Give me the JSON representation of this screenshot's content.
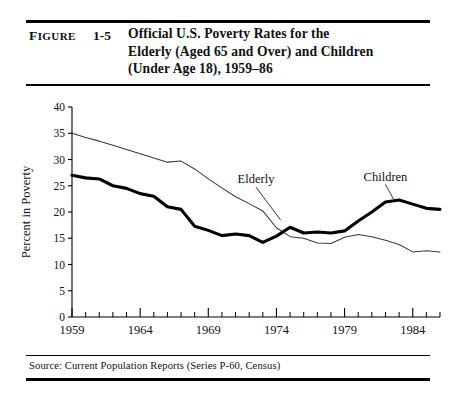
{
  "figure": {
    "label": "Figure",
    "number": "1-5",
    "title_lines": [
      "Official U.S. Poverty Rates for the",
      "Elderly (Aged 65 and Over) and Children",
      "(Under Age 18), 1959–86"
    ]
  },
  "source": {
    "text": "Source: Current Population Reports (Series P-60, Census)"
  },
  "annotations": {
    "elderly_label": "Elderly",
    "children_label": "Children"
  },
  "chart_data": {
    "type": "line",
    "title": "Official U.S. Poverty Rates for the Elderly (Aged 65 and Over) and Children (Under Age 18), 1959–86",
    "xlabel": "Year",
    "ylabel": "Percent in Poverty",
    "xlim": [
      1959,
      1986
    ],
    "ylim": [
      0,
      40
    ],
    "ytick_values": [
      0,
      5,
      10,
      15,
      20,
      25,
      30,
      35,
      40
    ],
    "ytick_labels": [
      "0",
      "5",
      "10",
      "15",
      "20",
      "25",
      "30",
      "35",
      "40"
    ],
    "xtick_major_values": [
      1959,
      1964,
      1969,
      1974,
      1979,
      1984
    ],
    "xtick_major_labels": [
      "1959",
      "1964",
      "1969",
      "1974",
      "1979",
      "1984"
    ],
    "xtick_minor_step": 1,
    "grid": false,
    "legend_position": "inline-annotations",
    "x": [
      1959,
      1960,
      1961,
      1962,
      1963,
      1964,
      1965,
      1966,
      1967,
      1968,
      1969,
      1970,
      1971,
      1972,
      1973,
      1974,
      1975,
      1976,
      1977,
      1978,
      1979,
      1980,
      1981,
      1982,
      1983,
      1984,
      1985,
      1986
    ],
    "series": [
      {
        "name": "Elderly",
        "style": "thin",
        "color": "#3a3a3a",
        "values": [
          35.0,
          34.2,
          33.5,
          32.7,
          31.9,
          31.1,
          30.3,
          29.5,
          29.7,
          28.2,
          26.3,
          24.6,
          22.9,
          21.6,
          20.2,
          17.0,
          15.3,
          15.0,
          14.1,
          14.0,
          15.2,
          15.7,
          15.3,
          14.6,
          13.8,
          12.4,
          12.6,
          12.4
        ]
      },
      {
        "name": "Children",
        "style": "thick",
        "color": "#000000",
        "values": [
          27.0,
          26.5,
          26.3,
          25.0,
          24.5,
          23.5,
          23.0,
          21.0,
          20.5,
          17.3,
          16.5,
          15.5,
          15.8,
          15.5,
          14.2,
          15.4,
          17.1,
          16.0,
          16.2,
          16.0,
          16.4,
          18.3,
          20.0,
          21.9,
          22.3,
          21.5,
          20.7,
          20.5
        ]
      }
    ],
    "annotations": [
      {
        "text": "Elderly",
        "x": 1972.5,
        "y": 25.5,
        "points_to_x": 1974.3,
        "points_to_y": 18.5
      },
      {
        "text": "Children",
        "x": 1982.0,
        "y": 26.0,
        "points_to_x": 1982.6,
        "points_to_y": 22.4
      }
    ]
  }
}
